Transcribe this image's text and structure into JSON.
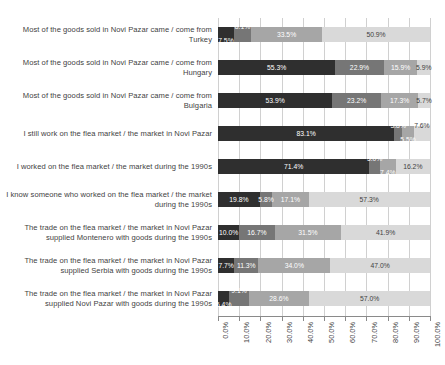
{
  "chart_data": {
    "type": "bar",
    "orientation": "horizontal",
    "stacked": true,
    "normalized_percent": true,
    "title": "",
    "subtitle": "",
    "xlabel": "",
    "ylabel": "",
    "xlim": [
      0,
      100
    ],
    "grid": true,
    "legend": "none",
    "value_suffix": "%",
    "series_colors": [
      "#2f2f2f",
      "#767676",
      "#a6a6a6",
      "#d9d9d9"
    ],
    "xticks": [
      "0.0%",
      "10.0%",
      "20.0%",
      "30.0%",
      "40.0%",
      "50.0%",
      "60.0%",
      "70.0%",
      "80.0%",
      "90.0%",
      "100.0%"
    ],
    "xtick_values": [
      0,
      10,
      20,
      30,
      40,
      50,
      60,
      70,
      80,
      90,
      100
    ],
    "categories": [
      "Most of the goods sold in Novi Pazar came / come from Turkey",
      "Most of the goods sold in Novi Pazar came / come from Hungary",
      "Most of the goods sold in Novi Pazar came / come from Bulgaria",
      "I still work on the flea market / the market in Novi Pazar",
      "I worked on the flea market / the market during the 1990s",
      "I know someone who worked on the flea market / the market during the 1990s",
      "The trade on the flea market / the market in Novi Pazar supplied Montenero with goods during the 1990s",
      "The trade on the flea market / the market in Novi Pazar supplied Serbia with goods during the 1990s",
      "The trade on the flea market / the market in Novi Pazar supplied Novi Pazar with goods during the 1990s"
    ],
    "series": [
      {
        "name": "series-1",
        "values": [
          7.5,
          55.3,
          53.9,
          83.1,
          71.4,
          19.8,
          10.0,
          7.7,
          5.4
        ]
      },
      {
        "name": "series-2",
        "values": [
          8.1,
          22.9,
          23.2,
          3.8,
          5.0,
          5.8,
          16.7,
          11.3,
          9.1
        ]
      },
      {
        "name": "series-3",
        "values": [
          33.5,
          15.9,
          17.3,
          5.5,
          7.4,
          17.1,
          31.5,
          34.0,
          28.6
        ]
      },
      {
        "name": "series-4",
        "values": [
          50.9,
          5.9,
          5.7,
          7.6,
          16.2,
          57.3,
          41.9,
          47.0,
          57.0
        ]
      }
    ],
    "bars": [
      {
        "category": "Most of the goods sold in Novi Pazar came / come from Turkey",
        "segments": [
          {
            "series": "series-1",
            "value": 7.5,
            "label": "7.5%",
            "label_position": "below"
          },
          {
            "series": "series-2",
            "value": 8.1,
            "label": "8.1%",
            "label_position": "above"
          },
          {
            "series": "series-3",
            "value": 33.5,
            "label": "33.5%",
            "label_position": "inside"
          },
          {
            "series": "series-4",
            "value": 50.9,
            "label": "50.9%",
            "label_position": "inside"
          }
        ]
      },
      {
        "category": "Most of the goods sold in Novi Pazar came / come from Hungary",
        "segments": [
          {
            "series": "series-1",
            "value": 55.3,
            "label": "55.3%",
            "label_position": "inside"
          },
          {
            "series": "series-2",
            "value": 22.9,
            "label": "22.9%",
            "label_position": "inside"
          },
          {
            "series": "series-3",
            "value": 15.9,
            "label": "15.9%",
            "label_position": "inside"
          },
          {
            "series": "series-4",
            "value": 5.9,
            "label": "5.9%",
            "label_position": "inside"
          }
        ]
      },
      {
        "category": "Most of the goods sold in Novi Pazar came / come from Bulgaria",
        "segments": [
          {
            "series": "series-1",
            "value": 53.9,
            "label": "53.9%",
            "label_position": "inside"
          },
          {
            "series": "series-2",
            "value": 23.2,
            "label": "23.2%",
            "label_position": "inside"
          },
          {
            "series": "series-3",
            "value": 17.3,
            "label": "17.3%",
            "label_position": "inside"
          },
          {
            "series": "series-4",
            "value": 5.7,
            "label": "5.7%",
            "label_position": "inside"
          }
        ]
      },
      {
        "category": "I still work on the flea market / the market in Novi Pazar",
        "segments": [
          {
            "series": "series-1",
            "value": 83.1,
            "label": "83.1%",
            "label_position": "inside"
          },
          {
            "series": "series-2",
            "value": 3.8,
            "label": "3.8%",
            "label_position": "above"
          },
          {
            "series": "series-3",
            "value": 5.5,
            "label": "5.5%",
            "label_position": "below"
          },
          {
            "series": "series-4",
            "value": 7.6,
            "label": "7.6%",
            "label_position": "above"
          }
        ]
      },
      {
        "category": "I worked on the flea market / the market during the 1990s",
        "segments": [
          {
            "series": "series-1",
            "value": 71.4,
            "label": "71.4%",
            "label_position": "inside"
          },
          {
            "series": "series-2",
            "value": 5.0,
            "label": "5.0%",
            "label_position": "above"
          },
          {
            "series": "series-3",
            "value": 7.4,
            "label": "7.4%",
            "label_position": "below"
          },
          {
            "series": "series-4",
            "value": 16.2,
            "label": "16.2%",
            "label_position": "inside"
          }
        ]
      },
      {
        "category": "I know someone who worked on the flea market / the market during the 1990s",
        "segments": [
          {
            "series": "series-1",
            "value": 19.8,
            "label": "19.8%",
            "label_position": "inside"
          },
          {
            "series": "series-2",
            "value": 5.8,
            "label": "5.8%",
            "label_position": "inside"
          },
          {
            "series": "series-3",
            "value": 17.1,
            "label": "17.1%",
            "label_position": "inside"
          },
          {
            "series": "series-4",
            "value": 57.3,
            "label": "57.3%",
            "label_position": "inside"
          }
        ]
      },
      {
        "category": "The trade on the flea market / the market in Novi Pazar supplied Montenero with goods during the 1990s",
        "segments": [
          {
            "series": "series-1",
            "value": 10.0,
            "label": "10.0%",
            "label_position": "inside"
          },
          {
            "series": "series-2",
            "value": 16.7,
            "label": "16.7%",
            "label_position": "inside"
          },
          {
            "series": "series-3",
            "value": 31.5,
            "label": "31.5%",
            "label_position": "inside"
          },
          {
            "series": "series-4",
            "value": 41.9,
            "label": "41.9%",
            "label_position": "inside"
          }
        ]
      },
      {
        "category": "The trade on the flea market / the market in Novi Pazar supplied Serbia with goods during the 1990s",
        "segments": [
          {
            "series": "series-1",
            "value": 7.7,
            "label": "7.7%",
            "label_position": "inside"
          },
          {
            "series": "series-2",
            "value": 11.3,
            "label": "11.3%",
            "label_position": "inside"
          },
          {
            "series": "series-3",
            "value": 34.0,
            "label": "34.0%",
            "label_position": "inside"
          },
          {
            "series": "series-4",
            "value": 47.0,
            "label": "47.0%",
            "label_position": "inside"
          }
        ]
      },
      {
        "category": "The trade on the flea market / the market in Novi Pazar supplied Novi Pazar with goods during the 1990s",
        "segments": [
          {
            "series": "series-1",
            "value": 5.4,
            "label": "5.4%",
            "label_position": "below"
          },
          {
            "series": "series-2",
            "value": 9.1,
            "label": "9.1%",
            "label_position": "above"
          },
          {
            "series": "series-3",
            "value": 28.6,
            "label": "28.6%",
            "label_position": "inside"
          },
          {
            "series": "series-4",
            "value": 57.0,
            "label": "57.0%",
            "label_position": "inside"
          }
        ]
      }
    ]
  }
}
